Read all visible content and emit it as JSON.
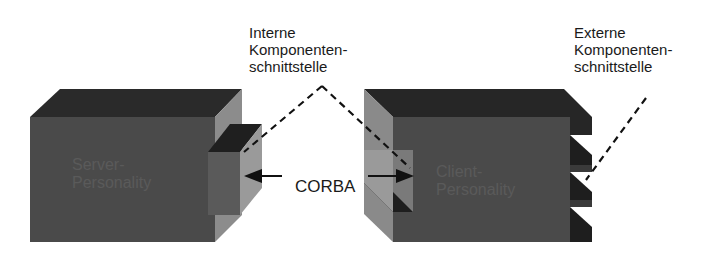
{
  "diagram": {
    "type": "component-architecture",
    "colors": {
      "front_face": "#4a4a4a",
      "top_face": "#2a2a2a",
      "side_face": "#8a8a8a",
      "dark_face": "#1e1e1e",
      "text": "#1a1a1a",
      "block_text": "#6a6a6a"
    },
    "blocks": [
      {
        "id": "server",
        "label": "Server-\nPersonality"
      },
      {
        "id": "client",
        "label": "Client-\nPersonality"
      }
    ],
    "connector": {
      "label": "CORBA"
    },
    "annotations": [
      {
        "id": "internal",
        "label": "Interne\nKomponenten-\nschnittstelle"
      },
      {
        "id": "external",
        "label": "Externe\nKomponenten-\nschnittstelle"
      }
    ]
  }
}
